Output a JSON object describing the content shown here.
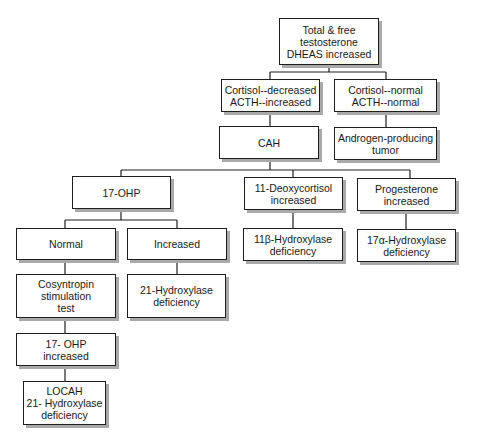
{
  "diagram": {
    "type": "flowchart",
    "nodes": [
      {
        "id": "root",
        "label": "Total & free\ntestosterone\nDHEAS increased",
        "x": 279,
        "y": 18,
        "w": 100,
        "h": 47
      },
      {
        "id": "cortisol_decreased",
        "label": "Cortisol--decreased\nACTH--increased",
        "x": 221,
        "y": 79,
        "w": 99,
        "h": 33
      },
      {
        "id": "cortisol_normal",
        "label": "Cortisol--normal\nACTH--normal",
        "x": 334,
        "y": 79,
        "w": 103,
        "h": 33
      },
      {
        "id": "cah",
        "label": "CAH",
        "x": 219,
        "y": 126,
        "w": 100,
        "h": 33
      },
      {
        "id": "androgen_tumor",
        "label": "Androgen-producing\ntumor",
        "x": 334,
        "y": 127,
        "w": 103,
        "h": 33
      },
      {
        "id": "ohp17",
        "label": "17-OHP",
        "x": 72,
        "y": 176,
        "w": 99,
        "h": 33
      },
      {
        "id": "deoxycortisol",
        "label": "11-Deoxycortisol\nincreased",
        "x": 244,
        "y": 177,
        "w": 99,
        "h": 33
      },
      {
        "id": "progesterone",
        "label": "Progesterone\nincreased",
        "x": 357,
        "y": 178,
        "w": 99,
        "h": 33
      },
      {
        "id": "normal",
        "label": "Normal",
        "x": 16,
        "y": 228,
        "w": 100,
        "h": 32
      },
      {
        "id": "increased",
        "label": "Increased",
        "x": 127,
        "y": 228,
        "w": 100,
        "h": 32
      },
      {
        "id": "hydroxylase11b",
        "label": "11β-Hydroxylase\ndeficiency",
        "x": 243,
        "y": 228,
        "w": 100,
        "h": 33
      },
      {
        "id": "hydroxylase17a",
        "label": "17α-Hydroxylase\ndeficiency",
        "x": 357,
        "y": 229,
        "w": 99,
        "h": 33
      },
      {
        "id": "cosyntropin",
        "label": "Cosyntropin\nstimulation\ntest",
        "x": 16,
        "y": 274,
        "w": 100,
        "h": 44
      },
      {
        "id": "hydroxylase21",
        "label": "21-Hydroxylase\ndeficiency",
        "x": 127,
        "y": 274,
        "w": 99,
        "h": 44
      },
      {
        "id": "ohp17_increased",
        "label": "17- OHP\nincreased",
        "x": 16,
        "y": 333,
        "w": 100,
        "h": 33
      },
      {
        "id": "locah",
        "label": "LOCAH\n21- Hydroxylase\ndeficiency",
        "x": 23,
        "y": 381,
        "w": 83,
        "h": 44
      }
    ],
    "edges": [
      {
        "from": "root",
        "to": "cortisol_decreased"
      },
      {
        "from": "root",
        "to": "cortisol_normal"
      },
      {
        "from": "cortisol_decreased",
        "to": "cah"
      },
      {
        "from": "cortisol_normal",
        "to": "androgen_tumor"
      },
      {
        "from": "cah",
        "to": "ohp17"
      },
      {
        "from": "cah",
        "to": "deoxycortisol"
      },
      {
        "from": "cah",
        "to": "progesterone"
      },
      {
        "from": "ohp17",
        "to": "normal"
      },
      {
        "from": "ohp17",
        "to": "increased"
      },
      {
        "from": "deoxycortisol",
        "to": "hydroxylase11b"
      },
      {
        "from": "progesterone",
        "to": "hydroxylase17a"
      },
      {
        "from": "normal",
        "to": "cosyntropin"
      },
      {
        "from": "increased",
        "to": "hydroxylase21"
      },
      {
        "from": "cosyntropin",
        "to": "ohp17_increased"
      },
      {
        "from": "ohp17_increased",
        "to": "locah"
      }
    ],
    "connector_lines": [
      [
        329,
        65,
        329,
        72
      ],
      [
        270,
        72,
        386,
        72
      ],
      [
        270,
        72,
        270,
        79
      ],
      [
        386,
        72,
        386,
        79
      ],
      [
        270,
        112,
        270,
        126
      ],
      [
        386,
        112,
        386,
        127
      ],
      [
        270,
        159,
        270,
        170
      ],
      [
        121,
        170,
        410,
        170
      ],
      [
        121,
        170,
        121,
        176
      ],
      [
        293,
        170,
        293,
        177
      ],
      [
        410,
        170,
        410,
        178
      ],
      [
        121,
        209,
        121,
        220
      ],
      [
        65,
        220,
        177,
        220
      ],
      [
        65,
        220,
        65,
        228
      ],
      [
        177,
        220,
        177,
        228
      ],
      [
        293,
        210,
        293,
        228
      ],
      [
        406,
        211,
        406,
        229
      ],
      [
        65,
        260,
        65,
        274
      ],
      [
        177,
        260,
        177,
        274
      ],
      [
        65,
        318,
        65,
        333
      ],
      [
        65,
        366,
        65,
        381
      ]
    ]
  }
}
